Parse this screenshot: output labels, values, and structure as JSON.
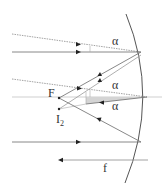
{
  "diagram": {
    "type": "concave-mirror-ray-diagram",
    "colors": {
      "ray": "#6a6a6a",
      "dotted_ray": "#8a8a8a",
      "axis": "#c8c8c8",
      "mirror": "#555555",
      "shade": "#d4d4d4",
      "arrow": "#222222",
      "text": "#333333"
    },
    "labels": {
      "alpha_top": "α",
      "alpha_mid_upper": "α",
      "alpha_mid_lower": "α",
      "focus": "F",
      "image_main": "I",
      "image_sub": "2",
      "focal_length": "f"
    }
  }
}
